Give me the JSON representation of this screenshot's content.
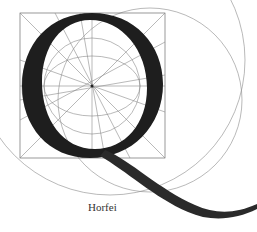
{
  "figure": {
    "caption": "Horfei",
    "colors": {
      "background": "#ffffff",
      "letter_ink": "#1e1e1e",
      "guide_lines": "#8a8a8a"
    },
    "construction": {
      "square": {
        "x": 20,
        "y": 13,
        "size": 145
      },
      "center": {
        "x": 92,
        "y": 86
      },
      "circles": [
        {
          "cx": 92,
          "cy": 86,
          "r": 48
        },
        {
          "cx": 92,
          "cy": 86,
          "r": 32
        },
        {
          "cx": 110,
          "cy": 60,
          "r": 135
        },
        {
          "cx": 150,
          "cy": 100,
          "r": 90
        }
      ]
    }
  }
}
